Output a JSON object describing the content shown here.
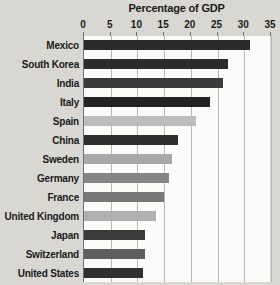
{
  "chart_data": {
    "type": "bar",
    "orientation": "horizontal",
    "title": "Percentage of GDP",
    "xlabel": "",
    "ylabel": "",
    "xlim": [
      0,
      35
    ],
    "xticks": [
      0,
      5,
      10,
      15,
      20,
      25,
      30,
      35
    ],
    "grid": true,
    "legend": "none",
    "categories": [
      "Mexico",
      "South Korea",
      "India",
      "Italy",
      "Spain",
      "China",
      "Sweden",
      "Germany",
      "France",
      "United Kingdom",
      "Japan",
      "Switzerland",
      "United States"
    ],
    "values": [
      31,
      27,
      26,
      23.5,
      21,
      17.5,
      16.5,
      16,
      15,
      13.5,
      11.5,
      11.5,
      11
    ],
    "bar_colors": [
      "#2b2b2b",
      "#2b2b2b",
      "#3a3a3a",
      "#242424",
      "#bdbdbd",
      "#2e2e2e",
      "#a8a8a8",
      "#858585",
      "#787878",
      "#b0b0b0",
      "#3b3b3b",
      "#5e5e5e",
      "#2f2f2f"
    ]
  },
  "colors": {
    "page_background": "#d9d7d2",
    "plot_background": "#fbfbfa",
    "gridline": "#b9b7b2",
    "axis": "#6f6f6f",
    "text": "#1a1a1a"
  }
}
